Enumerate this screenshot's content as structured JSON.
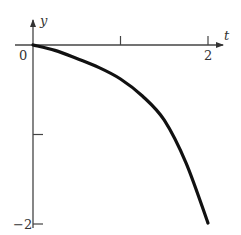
{
  "chart_data": {
    "type": "line",
    "title": "",
    "xlabel": "t",
    "ylabel": "y",
    "origin_label": "0",
    "x_ticks": [
      {
        "value": 1,
        "label": ""
      },
      {
        "value": 2,
        "label": "2"
      }
    ],
    "y_ticks": [
      {
        "value": -1,
        "label": ""
      },
      {
        "value": -2,
        "label": "−2"
      }
    ],
    "xlim": [
      0,
      2.15
    ],
    "ylim": [
      -2.05,
      0.25
    ],
    "grid": false,
    "legend": null,
    "series": [
      {
        "name": "y(t)",
        "color": "#111111",
        "x": [
          0,
          0.25,
          0.5,
          0.75,
          1.0,
          1.25,
          1.5,
          1.75,
          2.0
        ],
        "values": [
          0,
          -0.06,
          -0.15,
          -0.25,
          -0.38,
          -0.57,
          -0.84,
          -1.32,
          -1.99
        ]
      }
    ]
  },
  "style": {
    "axis_color": "#444444",
    "curve_color": "#111111"
  }
}
